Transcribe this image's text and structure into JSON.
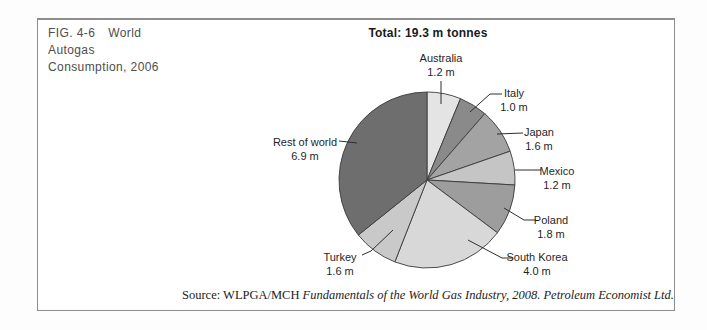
{
  "figure": {
    "fig_label": "FIG. 4-6",
    "title_line1": "World",
    "title_line2": "Autogas",
    "title_line3": "Consumption, 2006"
  },
  "total": {
    "label": "Total: 19.3 m tonnes"
  },
  "source": {
    "prefix": "Source: WLPGA/MCH ",
    "citation": "Fundamentals of the World Gas Industry, 2008. Petroleum Economist Ltd."
  },
  "chart_data": {
    "type": "pie",
    "title": "Total: 19.3 m tonnes",
    "total_value": 19.3,
    "unit": "million tonnes",
    "clockwise_from_top": true,
    "start_angle_deg": 0,
    "center": {
      "x": 427,
      "y": 180
    },
    "radius": 88,
    "stroke_color": "#3a3a3a",
    "leader_line_color": "#2e2e2e",
    "slices": [
      {
        "label": "Australia",
        "value": 1.2,
        "value_label": "1.2 m",
        "color": "#e4e4e4",
        "label_x": 441,
        "label_y": 62,
        "line": [
          [
            441,
            81
          ],
          [
            441,
            104
          ]
        ]
      },
      {
        "label": "Italy",
        "value": 1.0,
        "value_label": "1.0 m",
        "color": "#8a8a8a",
        "label_x": 514,
        "label_y": 97,
        "line": [
          [
            502,
            94
          ],
          [
            490,
            94
          ],
          [
            470,
            112
          ]
        ]
      },
      {
        "label": "Japan",
        "value": 1.6,
        "value_label": "1.6 m",
        "color": "#a3a3a3",
        "label_x": 539,
        "label_y": 136,
        "line": [
          [
            523,
            133
          ],
          [
            497,
            134
          ]
        ]
      },
      {
        "label": "Mexico",
        "value": 1.2,
        "value_label": "1.2 m",
        "color": "#c5c5c5",
        "label_x": 557,
        "label_y": 175,
        "line": [
          [
            541,
            170
          ],
          [
            515,
            170
          ]
        ]
      },
      {
        "label": "Poland",
        "value": 1.8,
        "value_label": "1.8 m",
        "color": "#9d9d9d",
        "label_x": 551,
        "label_y": 224,
        "line": [
          [
            536,
            220
          ],
          [
            524,
            220
          ],
          [
            504,
            208
          ]
        ]
      },
      {
        "label": "South Korea",
        "value": 4.0,
        "value_label": "4.0 m",
        "color": "#d8d8d8",
        "label_x": 537,
        "label_y": 261,
        "line": [
          [
            513,
            258
          ],
          [
            502,
            258
          ],
          [
            468,
            240
          ]
        ]
      },
      {
        "label": "Turkey",
        "value": 1.6,
        "value_label": "1.6 m",
        "color": "#c9c9c9",
        "label_x": 340,
        "label_y": 261,
        "line": [
          [
            362,
            255
          ],
          [
            371,
            251
          ],
          [
            393,
            230
          ]
        ]
      },
      {
        "label": "Rest of world",
        "value": 6.9,
        "value_label": "6.9 m",
        "color": "#6e6e6e",
        "label_x": 305,
        "label_y": 146,
        "line": [
          [
            339,
            141
          ],
          [
            357,
            143
          ]
        ]
      }
    ]
  }
}
